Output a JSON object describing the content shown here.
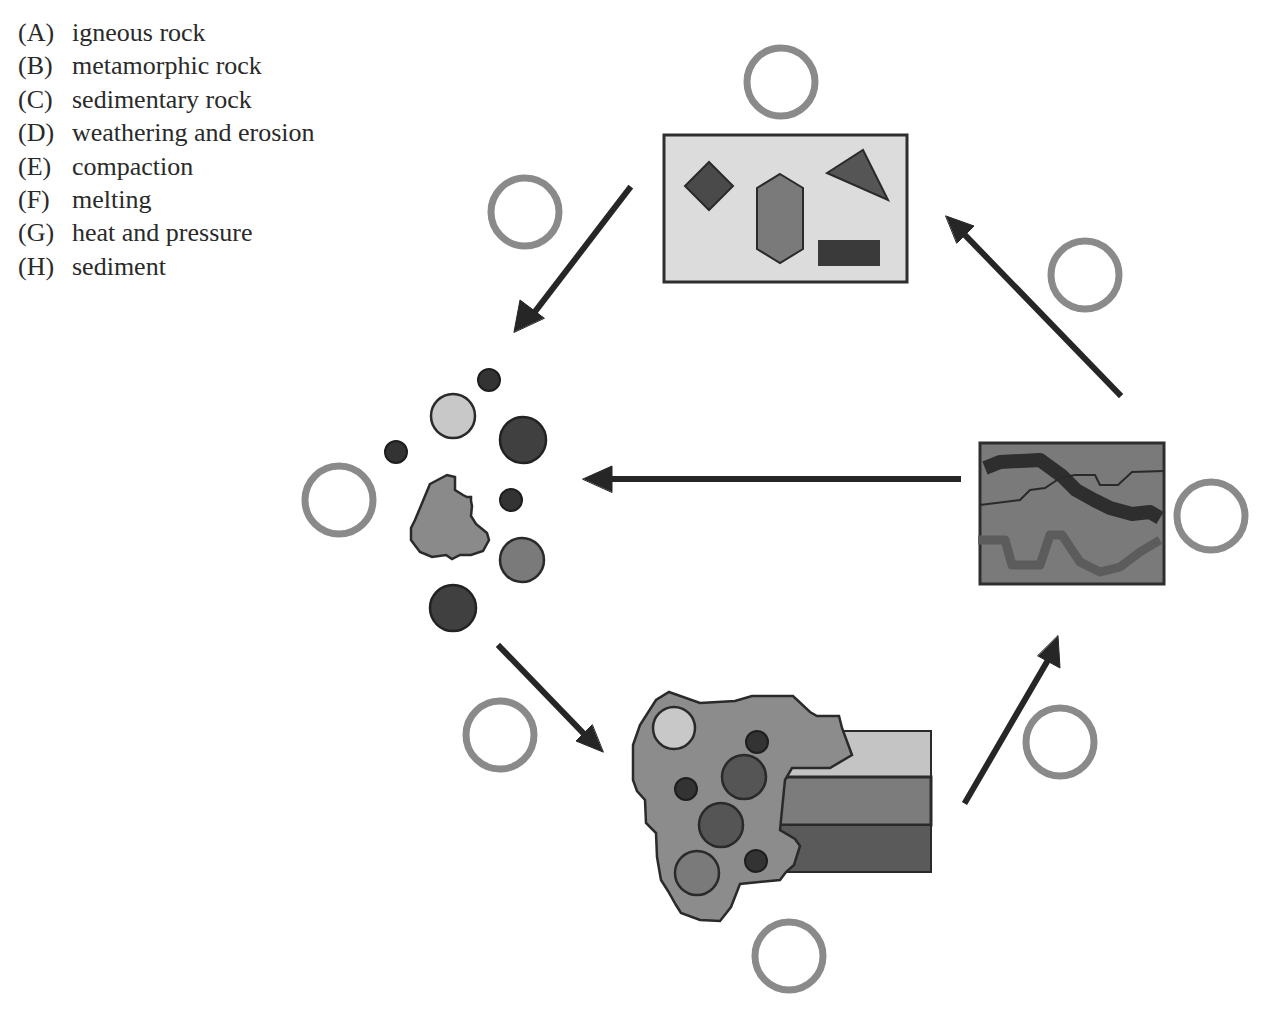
{
  "legend": {
    "items": [
      {
        "letter": "(A)",
        "label": "igneous rock"
      },
      {
        "letter": "(B)",
        "label": "metamorphic rock"
      },
      {
        "letter": "(C)",
        "label": "sedimentary rock"
      },
      {
        "letter": "(D)",
        "label": "weathering and erosion"
      },
      {
        "letter": "(E)",
        "label": "compaction"
      },
      {
        "letter": "(F)",
        "label": "melting"
      },
      {
        "letter": "(G)",
        "label": "heat and pressure"
      },
      {
        "letter": "(H)",
        "label": "sediment"
      }
    ]
  },
  "diagram": {
    "nodes": [
      {
        "id": "igneous-rock-box",
        "depicts": "light box with diamond, hexagon, triangle, rectangle crystals"
      },
      {
        "id": "sediment-cluster",
        "depicts": "loose pebbles and rock fragment"
      },
      {
        "id": "sedimentary-rock-block",
        "depicts": "cemented pebbles with layered strata"
      },
      {
        "id": "metamorphic-rock-box",
        "depicts": "dark box with folded bands"
      }
    ],
    "answer_circles": [
      {
        "id": "circle-igneous",
        "position": "top"
      },
      {
        "id": "circle-weathering",
        "position": "upper-left"
      },
      {
        "id": "circle-melting",
        "position": "upper-right"
      },
      {
        "id": "circle-sediment",
        "position": "left"
      },
      {
        "id": "circle-metamorphic",
        "position": "right"
      },
      {
        "id": "circle-compaction",
        "position": "lower-left"
      },
      {
        "id": "circle-heat-pressure",
        "position": "lower-right"
      },
      {
        "id": "circle-sedimentary",
        "position": "bottom"
      }
    ],
    "colors": {
      "answer_circle": "#8a8a8a",
      "arrow": "#262626",
      "igneous_bg": "#dcdcdc",
      "metamorphic_bg": "#7a7a7a",
      "dark_fill": "#3c3c3c",
      "mid_fill": "#6e6e6e",
      "light_fill": "#c8c8c8",
      "rock_fill": "#8c8c8c"
    }
  }
}
